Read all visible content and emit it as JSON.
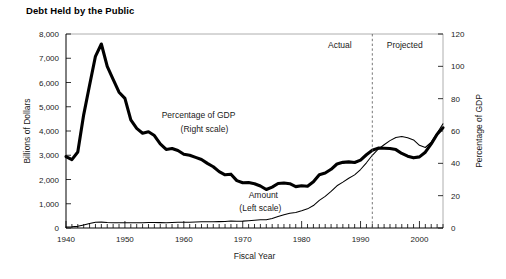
{
  "chart_data": {
    "type": "line",
    "title": "Debt Held by the Public",
    "xlabel": "Fiscal Year",
    "ylabel": "Billions of Dollars",
    "y2label": "Percentage of GDP",
    "xlim": [
      1940,
      2004
    ],
    "ylim": [
      0,
      8000
    ],
    "y2lim": [
      0,
      120
    ],
    "grid": false,
    "legend_position": "inline-annotations",
    "xticks": [
      1940,
      1950,
      1960,
      1970,
      1980,
      1990,
      2000
    ],
    "xticklabels": [
      "1940",
      "1950",
      "1960",
      "1970",
      "1980",
      "1990",
      "2000"
    ],
    "xminor_step": 1,
    "yticks": [
      0,
      1000,
      2000,
      3000,
      4000,
      5000,
      6000,
      7000,
      8000
    ],
    "yticklabels": [
      "0",
      "1,000",
      "2,000",
      "3,000",
      "4,000",
      "5,000",
      "6,000",
      "7,000",
      "8,000"
    ],
    "y2ticks": [
      0,
      20,
      40,
      60,
      80,
      100,
      120
    ],
    "y2ticklabels": [
      "0",
      "20",
      "40",
      "60",
      "80",
      "100",
      "120"
    ],
    "annotations": [
      {
        "name": "actual-label",
        "text": "Actual",
        "x": 1986.5,
        "y_frac": 0.93
      },
      {
        "name": "projected-label",
        "text": "Projected",
        "x": 1997.5,
        "y_frac": 0.93
      },
      {
        "name": "pct-series-label",
        "text": "Percentage of GDP",
        "x": 1962.5,
        "y_frac": 0.565
      },
      {
        "name": "pct-series-sublabel",
        "text": "(Right scale)",
        "x": 1963.5,
        "y_frac": 0.495
      },
      {
        "name": "amount-series-label",
        "text": "Amount",
        "x": 1973.5,
        "y_frac": 0.155
      },
      {
        "name": "amount-series-sublabel",
        "text": "(Left scale)",
        "x": 1973.0,
        "y_frac": 0.088
      }
    ],
    "divider": {
      "x": 1992,
      "label_left": "Actual",
      "label_right": "Projected"
    },
    "series": [
      {
        "name": "Percentage of GDP",
        "axis": "right",
        "style": "thick",
        "x": [
          1940,
          1941,
          1942,
          1943,
          1944,
          1945,
          1946,
          1947,
          1948,
          1949,
          1950,
          1951,
          1952,
          1953,
          1954,
          1955,
          1956,
          1957,
          1958,
          1959,
          1960,
          1961,
          1962,
          1963,
          1964,
          1965,
          1966,
          1967,
          1968,
          1969,
          1970,
          1971,
          1972,
          1973,
          1974,
          1975,
          1976,
          1977,
          1978,
          1979,
          1980,
          1981,
          1982,
          1983,
          1984,
          1985,
          1986,
          1987,
          1988,
          1989,
          1990,
          1991,
          1992,
          1993,
          1994,
          1995,
          1996,
          1997,
          1998,
          1999,
          2000,
          2001,
          2002,
          2003,
          2004
        ],
        "values": [
          44.2,
          42.3,
          47.0,
          70.0,
          88.3,
          106.2,
          113.8,
          100.0,
          92.0,
          84.0,
          80.2,
          66.9,
          61.6,
          58.6,
          59.5,
          57.2,
          52.0,
          48.6,
          49.2,
          47.9,
          45.6,
          45.0,
          43.7,
          42.4,
          40.0,
          37.9,
          34.9,
          32.9,
          33.3,
          29.3,
          28.0,
          28.1,
          27.4,
          26.0,
          23.8,
          25.3,
          27.5,
          27.8,
          27.4,
          25.6,
          26.1,
          25.8,
          28.6,
          33.0,
          34.0,
          36.3,
          39.6,
          40.6,
          40.9,
          40.5,
          42.0,
          45.3,
          48.1,
          49.4,
          49.3,
          49.2,
          48.5,
          46.1,
          44.4,
          43.4,
          44.0,
          46.9,
          52.0,
          58.0,
          62.0
        ]
      },
      {
        "name": "Amount",
        "axis": "left",
        "style": "thin",
        "x": [
          1940,
          1941,
          1942,
          1943,
          1944,
          1945,
          1946,
          1947,
          1948,
          1949,
          1950,
          1951,
          1952,
          1953,
          1954,
          1955,
          1956,
          1957,
          1958,
          1959,
          1960,
          1961,
          1962,
          1963,
          1964,
          1965,
          1966,
          1967,
          1968,
          1969,
          1970,
          1971,
          1972,
          1973,
          1974,
          1975,
          1976,
          1977,
          1978,
          1979,
          1980,
          1981,
          1982,
          1983,
          1984,
          1985,
          1986,
          1987,
          1988,
          1989,
          1990,
          1991,
          1992,
          1993,
          1994,
          1995,
          1996,
          1997,
          1998,
          1999,
          2000,
          2001,
          2002,
          2003,
          2004
        ],
        "values": [
          42.7,
          48.2,
          67.8,
          127.8,
          184.8,
          235.2,
          241.9,
          224.3,
          216.3,
          214.3,
          219.0,
          214.3,
          214.8,
          218.4,
          224.5,
          226.6,
          222.2,
          219.3,
          226.3,
          235.0,
          236.8,
          238.4,
          248.0,
          254.0,
          256.8,
          260.8,
          263.7,
          266.6,
          289.5,
          278.1,
          283.2,
          303.0,
          322.4,
          340.9,
          343.7,
          394.7,
          477.4,
          549.1,
          607.1,
          640.3,
          711.9,
          789.4,
          924.6,
          1137.3,
          1307.0,
          1507.3,
          1740.6,
          1889.8,
          2051.6,
          2190.7,
          2411.6,
          2689.0,
          2999.7,
          3248.4,
          3433.1,
          3604.4,
          3734.1,
          3772.3,
          3721.1,
          3632.4,
          3409.8,
          3319.6,
          3540.4,
          3913.4,
          4295.5
        ],
        "display_scale_note": "drawn on left axis; projected segment rises steeply after 1992"
      }
    ]
  },
  "figure": {
    "title": "Debt Held by the Public"
  }
}
